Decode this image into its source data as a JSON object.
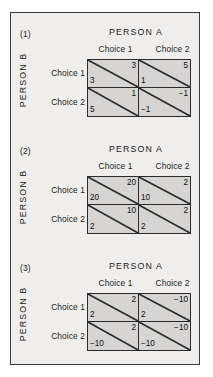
{
  "figure": {
    "column_party_label": "PERSON A",
    "row_party_label": "PERSON B",
    "column_choices": [
      "Choice 1",
      "Choice 2"
    ],
    "row_choices": [
      "Choice 1",
      "Choice 2"
    ],
    "colors": {
      "page_background": "#ffffff",
      "panel_background": "#efeeec",
      "cell_fill": "#d6d5d3",
      "line": "#2b2b2b",
      "frame": "#3a3a3a",
      "text": "#1b1b1b"
    },
    "panels": [
      {
        "number": "(1)",
        "column_party_label": "PERSON A",
        "row_party_label": "PERSON B",
        "column_choices": [
          "Choice 1",
          "Choice 2"
        ],
        "row_choices": [
          "Choice 1",
          "Choice 2"
        ],
        "cells": [
          [
            {
              "person_a": "3",
              "person_b": "3"
            },
            {
              "person_a": "5",
              "person_b": "1"
            }
          ],
          [
            {
              "person_a": "1",
              "person_b": "5"
            },
            {
              "person_a": "−1",
              "person_b": "−1"
            }
          ]
        ]
      },
      {
        "number": "(2)",
        "column_party_label": "PERSON A",
        "row_party_label": "PERSON B",
        "column_choices": [
          "Choice 1",
          "Choice 2"
        ],
        "row_choices": [
          "Choice 1",
          "Choice 2"
        ],
        "cells": [
          [
            {
              "person_a": "20",
              "person_b": "20"
            },
            {
              "person_a": "2",
              "person_b": "10"
            }
          ],
          [
            {
              "person_a": "10",
              "person_b": "2"
            },
            {
              "person_a": "2",
              "person_b": "2"
            }
          ]
        ]
      },
      {
        "number": "(3)",
        "column_party_label": "PERSON A",
        "row_party_label": "PERSON B",
        "column_choices": [
          "Choice 1",
          "Choice 2"
        ],
        "row_choices": [
          "Choice 1",
          "Choice 2"
        ],
        "cells": [
          [
            {
              "person_a": "2",
              "person_b": "2"
            },
            {
              "person_a": "−10",
              "person_b": "2"
            }
          ],
          [
            {
              "person_a": "2",
              "person_b": "−10"
            },
            {
              "person_a": "−10",
              "person_b": "−10"
            }
          ]
        ]
      }
    ]
  }
}
